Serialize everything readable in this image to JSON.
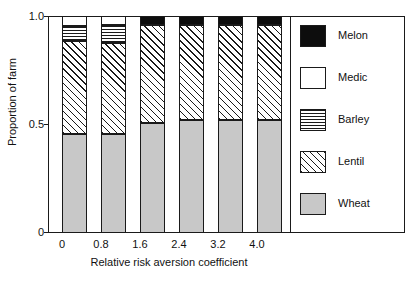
{
  "chart_data": {
    "type": "bar",
    "subtype": "stacked-bar",
    "title": "",
    "xlabel": "Relative risk aversion coefficient",
    "ylabel": "Proportion of farm",
    "categories": [
      "0",
      "0.8",
      "1.6",
      "2.4",
      "3.2",
      "4.0"
    ],
    "xtick_labels": [
      "0",
      "0.8",
      "1.6",
      "2.4",
      "3.2",
      "4.0"
    ],
    "ytick_labels": [
      "0",
      "0.5",
      "1.0"
    ],
    "ytick_values": [
      0,
      0.5,
      1.0
    ],
    "ylim": [
      0,
      1.0
    ],
    "grid": false,
    "legend_position": "right",
    "stack_order_bottom_to_top": [
      "Wheat",
      "Lentil",
      "Barley",
      "Medic",
      "Melon"
    ],
    "series": [
      {
        "name": "Wheat",
        "pattern": "solid-gray",
        "color": "#c8c8c8",
        "values": [
          0.455,
          0.455,
          0.505,
          0.52,
          0.52,
          0.52
        ]
      },
      {
        "name": "Lentil",
        "pattern": "diagonal-hatch",
        "color": "#ffffff",
        "values": [
          0.43,
          0.42,
          0.455,
          0.44,
          0.44,
          0.44
        ]
      },
      {
        "name": "Barley",
        "pattern": "horizontal-lines",
        "color": "#ffffff",
        "values": [
          0.07,
          0.085,
          0.0,
          0.0,
          0.0,
          0.0
        ]
      },
      {
        "name": "Medic",
        "pattern": "white-fill",
        "color": "#ffffff",
        "values": [
          0.045,
          0.04,
          0.0,
          0.0,
          0.0,
          0.0
        ]
      },
      {
        "name": "Melon",
        "pattern": "solid-black",
        "color": "#0d0d0d",
        "values": [
          0.0,
          0.0,
          0.04,
          0.04,
          0.04,
          0.04
        ]
      }
    ]
  },
  "axes": {
    "y_label": "Proportion of farm",
    "x_label": "Relative risk aversion coefficient",
    "y_ticks": [
      {
        "label": "1.0",
        "value": 1.0
      },
      {
        "label": "0.5",
        "value": 0.5
      },
      {
        "label": "0",
        "value": 0.0
      }
    ],
    "x_ticks": [
      {
        "label": "0"
      },
      {
        "label": "0.8"
      },
      {
        "label": "1.6"
      },
      {
        "label": "2.4"
      },
      {
        "label": "3.2"
      },
      {
        "label": "4.0"
      }
    ]
  },
  "legend": {
    "items": [
      {
        "label": "Melon",
        "pattern": "solid-black"
      },
      {
        "label": "Medic",
        "pattern": "white-fill"
      },
      {
        "label": "Barley",
        "pattern": "horizontal-lines"
      },
      {
        "label": "Lentil",
        "pattern": "diagonal-hatch"
      },
      {
        "label": "Wheat",
        "pattern": "solid-gray"
      }
    ]
  },
  "colors": {
    "wheat": "#c8c8c8",
    "melon": "#0d0d0d",
    "medic": "#ffffff",
    "lentil": "#ffffff",
    "barley": "#ffffff",
    "axis": "#1a1a1a",
    "background": "#ffffff"
  }
}
